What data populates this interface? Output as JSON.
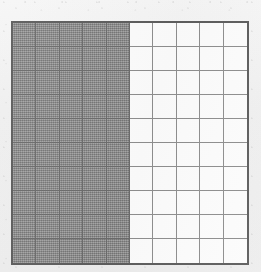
{
  "figure": {
    "kind": "hundredths-grid-fraction-model",
    "background_color": "#f1f1f1",
    "grid_border_color": "#5d5d5d",
    "gridline_color": "#8e8e8e",
    "shaded_gridline_color": "#6b6b6b",
    "shaded_cell_color": "#8d8d8d",
    "unshaded_cell_color": "#fcfcfc",
    "caption": ""
  },
  "chart_data": {
    "type": "heatmap",
    "title": "",
    "subtitle": "",
    "xlabel": "",
    "ylabel": "",
    "rows": 10,
    "columns": 10,
    "total_cells": 100,
    "shaded_cells": 50,
    "unshaded_cells": 50,
    "shaded_fraction": "50/100",
    "shaded_decimal": 0.5,
    "shaded_percent": 50,
    "shading_region": "left 5 columns, all 10 rows",
    "legend": [],
    "grid": true,
    "values": [
      [
        1,
        1,
        1,
        1,
        1,
        0,
        0,
        0,
        0,
        0
      ],
      [
        1,
        1,
        1,
        1,
        1,
        0,
        0,
        0,
        0,
        0
      ],
      [
        1,
        1,
        1,
        1,
        1,
        0,
        0,
        0,
        0,
        0
      ],
      [
        1,
        1,
        1,
        1,
        1,
        0,
        0,
        0,
        0,
        0
      ],
      [
        1,
        1,
        1,
        1,
        1,
        0,
        0,
        0,
        0,
        0
      ],
      [
        1,
        1,
        1,
        1,
        1,
        0,
        0,
        0,
        0,
        0
      ],
      [
        1,
        1,
        1,
        1,
        1,
        0,
        0,
        0,
        0,
        0
      ],
      [
        1,
        1,
        1,
        1,
        1,
        0,
        0,
        0,
        0,
        0
      ],
      [
        1,
        1,
        1,
        1,
        1,
        0,
        0,
        0,
        0,
        0
      ],
      [
        1,
        1,
        1,
        1,
        1,
        0,
        0,
        0,
        0,
        0
      ]
    ]
  }
}
